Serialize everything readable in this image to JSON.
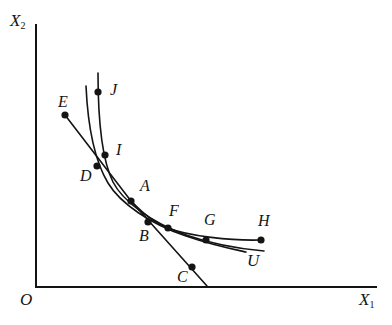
{
  "figure": {
    "background": "#ffffff",
    "ink": "#141414",
    "width": 392,
    "height": 325
  },
  "axes": {
    "x_label": "X",
    "x_sub": "1",
    "y_label": "X",
    "y_sub": "2",
    "origin_label": "O",
    "x_axis": {
      "x1": 36,
      "y1": 287,
      "x2": 376,
      "y2": 287
    },
    "y_axis": {
      "x1": 36,
      "y1": 25,
      "x2": 36,
      "y2": 287
    }
  },
  "chart_data": {
    "type": "scatter",
    "title": "",
    "xlabel": "X1",
    "ylabel": "X2",
    "grid": false,
    "legend": "none",
    "points": [
      {
        "name": "E",
        "x": 65,
        "y": 115,
        "label_x": 58,
        "label_y": 94
      },
      {
        "name": "J",
        "x": 98,
        "y": 92,
        "label_x": 110,
        "label_y": 82
      },
      {
        "name": "I",
        "x": 105,
        "y": 155,
        "label_x": 116,
        "label_y": 142
      },
      {
        "name": "D",
        "x": 97,
        "y": 166,
        "label_x": 80,
        "label_y": 168
      },
      {
        "name": "A",
        "x": 131,
        "y": 201,
        "label_x": 140,
        "label_y": 178
      },
      {
        "name": "B",
        "x": 148,
        "y": 222,
        "label_x": 139,
        "label_y": 228
      },
      {
        "name": "F",
        "x": 168,
        "y": 228,
        "label_x": 169,
        "label_y": 203
      },
      {
        "name": "G",
        "x": 206,
        "y": 240,
        "label_x": 204,
        "label_y": 212
      },
      {
        "name": "H",
        "x": 261,
        "y": 240,
        "label_x": 258,
        "label_y": 213
      },
      {
        "name": "C",
        "x": 192,
        "y": 267,
        "label_x": 177,
        "label_y": 269
      }
    ],
    "curve_labels": [
      {
        "name": "U",
        "label_x": 247,
        "label_y": 252
      }
    ],
    "curves": [
      {
        "name": "isoquant-outer-JIA",
        "path": "M 98,73 C 98,120 102,160 113,182 C 122,200 150,222 186,235 C 215,245 240,249 264,251"
      },
      {
        "name": "isoquant-inner-DA",
        "path": "M 86,86 C 88,130 96,163 108,183 C 120,203 150,224 186,236 C 212,245 232,249 246,252"
      },
      {
        "name": "budget-line-EDAC",
        "path": "M 65,115 L 131,201 L 207,286"
      },
      {
        "name": "expansion-path-AFGH",
        "path": "M 131,201 C 146,216 156,224 168,228 C 188,236 232,241 261,240"
      }
    ]
  },
  "dot_radius": 3.6,
  "stroke_width": 1.6,
  "axis_stroke_width": 2.0
}
